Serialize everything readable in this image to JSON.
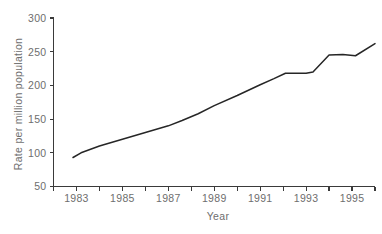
{
  "chart_data": {
    "type": "line",
    "title": "",
    "xlabel": "Year",
    "ylabel": "Rate per million population",
    "xlim": [
      1982,
      1996
    ],
    "ylim": [
      50,
      300
    ],
    "grid": false,
    "legend": "none",
    "x_major_tick_labels": [
      "1983",
      "1985",
      "1987",
      "1989",
      "1991",
      "1993",
      "1995"
    ],
    "x_major_tick_values": [
      1983,
      1985,
      1987,
      1989,
      1991,
      1993,
      1995
    ],
    "x_all_tick_values": [
      1982,
      1983,
      1984,
      1985,
      1986,
      1987,
      1988,
      1989,
      1990,
      1991,
      1992,
      1993,
      1994,
      1995,
      1996
    ],
    "y_tick_labels": [
      "50",
      "100",
      "150",
      "200",
      "250",
      "300"
    ],
    "y_tick_values": [
      50,
      100,
      150,
      200,
      250,
      300
    ],
    "series": [
      {
        "name": "Rate per million population",
        "color": "#262626",
        "x": [
          1982.85,
          1983.2,
          1984.0,
          1985.0,
          1986.0,
          1987.0,
          1987.6,
          1988.3,
          1989.0,
          1990.0,
          1991.0,
          1991.6,
          1992.1,
          1993.0,
          1993.3,
          1994.0,
          1994.6,
          1995.15,
          1996.0
        ],
        "values": [
          93,
          100,
          110,
          120,
          130,
          140,
          148,
          158,
          170,
          185,
          201,
          210,
          218,
          218,
          220,
          245,
          246,
          244,
          262
        ]
      }
    ]
  },
  "axes": {
    "x_axis_name": "year-axis",
    "y_axis_name": "rate-axis"
  }
}
